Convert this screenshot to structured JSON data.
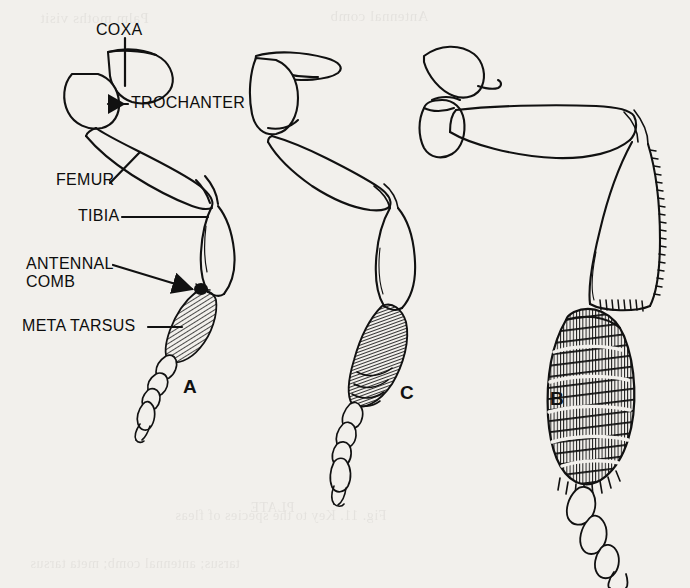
{
  "figure": {
    "background_color": "#f2f0ec",
    "ink_color": "#111111",
    "width": 690,
    "height": 588
  },
  "annotations": [
    {
      "id": "coxa",
      "label": "COXA",
      "x": 96,
      "y": 22,
      "leader": "vertical"
    },
    {
      "id": "trochanter",
      "label": "TROCHANTER",
      "x": 131,
      "y": 96,
      "leader": "horizontal-arrow-left"
    },
    {
      "id": "femur",
      "label": "FEMUR",
      "x": 56,
      "y": 172,
      "leader": "diagonal-up-right"
    },
    {
      "id": "tibia",
      "label": "TIBIA",
      "x": 78,
      "y": 208,
      "leader": "horizontal"
    },
    {
      "id": "antennal-comb",
      "label": "ANTENNAL",
      "x": 26,
      "y": 258,
      "leader": "diagonal-arrow-down-right"
    },
    {
      "id": "antennal-comb-2",
      "label": "COMB",
      "x": 26,
      "y": 275,
      "leader": "none"
    },
    {
      "id": "meta-tarsus",
      "label": "META TARSUS",
      "x": 22,
      "y": 320,
      "leader": "horizontal-short"
    }
  ],
  "specimens": [
    {
      "id": "a",
      "letter": "A",
      "letter_x": 183,
      "letter_y": 376,
      "description": "Leg with slender hatched metatarsus and antennal comb"
    },
    {
      "id": "c",
      "letter": "C",
      "letter_x": 400,
      "letter_y": 382,
      "description": "Leg with broad densely hatched metatarsus"
    },
    {
      "id": "b",
      "letter": "B",
      "letter_x": 550,
      "letter_y": 388,
      "description": "Leg with very broad banded metatarsus and serrate tibia"
    }
  ],
  "ghost_text": [
    {
      "text": "Palm moths visit",
      "x": 40,
      "y": 10,
      "size": 15
    },
    {
      "text": "Antennal comb",
      "x": 330,
      "y": 8,
      "size": 15
    },
    {
      "text": "PLATE",
      "x": 250,
      "y": 500,
      "size": 14
    },
    {
      "text": "Fig. 11. Key to the species of fleas",
      "x": 175,
      "y": 508,
      "size": 14
    },
    {
      "text": "tarsus; antennal comb; meta tarsus",
      "x": 30,
      "y": 556,
      "size": 14
    }
  ]
}
